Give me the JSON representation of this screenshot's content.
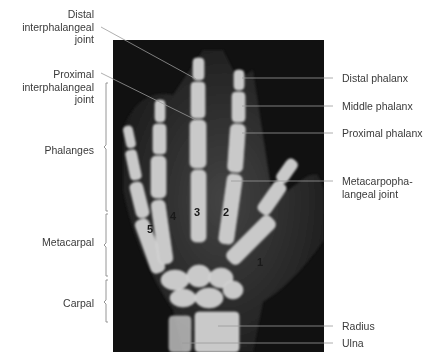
{
  "figure": {
    "left_labels": {
      "distal_ip_joint": [
        "Distal",
        "interphalangeal",
        "joint"
      ],
      "proximal_ip_joint": [
        "Proximal",
        "interphalangeal",
        "joint"
      ]
    },
    "brackets": {
      "phalanges": "Phalanges",
      "metacarpal": "Metacarpal",
      "carpal": "Carpal"
    },
    "right_labels": {
      "distal_phalanx": "Distal phalanx",
      "middle_phalanx": "Middle phalanx",
      "proximal_phalanx": "Proximal phalanx",
      "mcp_joint": [
        "Metacarpopha-",
        "langeal joint"
      ],
      "radius": "Radius",
      "ulna": "Ulna"
    },
    "digit_numbers": [
      "1",
      "2",
      "3",
      "4",
      "5"
    ],
    "colors": {
      "background": "#ffffff",
      "xray_bg": "#111111",
      "bone": "#c8c8c8",
      "leader_line": "#8a8a8a",
      "text": "#3a3a3a"
    }
  }
}
